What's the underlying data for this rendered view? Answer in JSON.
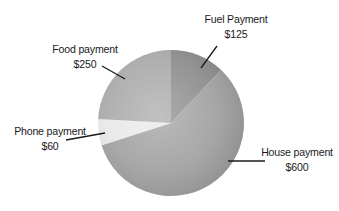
{
  "chart_data": {
    "type": "pie",
    "title": "",
    "categories": [
      "Fuel Payment",
      "House payment",
      "Phone payment",
      "Food payment"
    ],
    "values": [
      125,
      600,
      60,
      250
    ],
    "value_labels": [
      "$125",
      "$600",
      "$60",
      "$250"
    ],
    "colors": [
      "#8c8c8c",
      "#a0a0a0",
      "#e8e8e8",
      "#a9a9a9"
    ],
    "start_angle_deg": 0,
    "direction": "clockwise",
    "legend": "none",
    "labels_position": "outside-with-leader-lines",
    "total": 1035
  },
  "labels": {
    "fuel": {
      "name": "Fuel Payment",
      "value": "$125"
    },
    "house": {
      "name": "House payment",
      "value": "$600"
    },
    "phone": {
      "name": "Phone payment",
      "value": "$60"
    },
    "food": {
      "name": "Food payment",
      "value": "$250"
    }
  }
}
